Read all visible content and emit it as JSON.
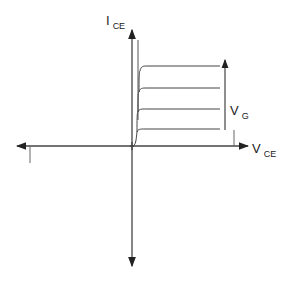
{
  "diagram": {
    "y_axis": {
      "label_main": "I",
      "label_sub": "CE"
    },
    "x_axis": {
      "label_main": "V",
      "label_sub": "CE"
    },
    "gate_arrow": {
      "label_main": "V",
      "label_sub": "G"
    },
    "curve_levels_px": [
      66,
      88,
      109,
      129
    ],
    "colors": {
      "line": "#444444",
      "axis": "#333333"
    }
  }
}
